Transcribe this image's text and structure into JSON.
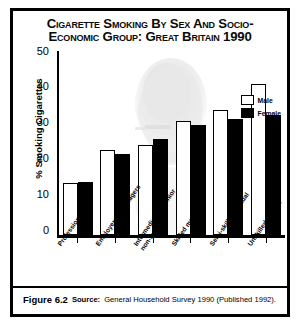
{
  "figure": {
    "title_line_1": "Cigarette Smoking By Sex and Socio-",
    "title_line_2": "Economic Group: Great Britain 1990",
    "caption_figure": "Figure 6.2",
    "caption_source_label": "Source:",
    "caption_source_text": "General Household Survey 1990 (Published 1992)."
  },
  "legend": {
    "items": [
      {
        "label": "Male",
        "color": "#ffffff",
        "swatch": "male-swatch"
      },
      {
        "label": "Female",
        "color": "#000000",
        "swatch": "female-swatch"
      }
    ]
  },
  "axes": {
    "y_ticks": [
      "50",
      "40",
      "30",
      "20",
      "10",
      "0"
    ]
  },
  "chart_data": {
    "type": "bar",
    "subtitle": "",
    "xlabel": "",
    "ylabel": "% Smoking Cigarettes",
    "ylim": [
      0,
      50
    ],
    "yticks": [
      0,
      10,
      20,
      30,
      40,
      50
    ],
    "grid": false,
    "legend_position": "top-right",
    "categories": [
      "Professional",
      "Employers & Managers",
      "Intermediate & Junior non-manual",
      "Skilled manual",
      "Semi-skilled manual",
      "Unskilled Manual"
    ],
    "series": [
      {
        "name": "Male",
        "color": "#ffffff",
        "values": [
          14,
          23,
          24.5,
          31,
          34,
          41
        ]
      },
      {
        "name": "Female",
        "color": "#000000",
        "values": [
          14.5,
          22,
          26,
          30,
          31.5,
          32.5
        ]
      }
    ],
    "annotations": [
      "Background watermark photograph of a person smoking a cigarette"
    ]
  }
}
